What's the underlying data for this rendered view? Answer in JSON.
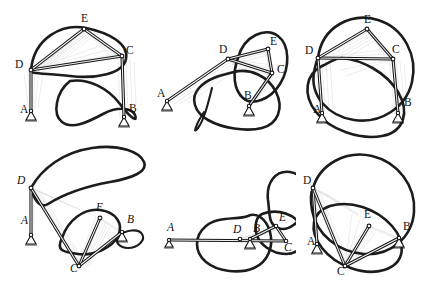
{
  "figure": {
    "background_color": "#ffffff",
    "curve_color": "#1c1c1c",
    "ghost_color": "#c9c9c9",
    "link_color": "#161616",
    "columns": 3,
    "rows": 2,
    "panel_width": 148,
    "panel_height": 143
  },
  "panels": [
    {
      "id": "panel-top-left",
      "name": "top-left",
      "row": 0,
      "col": 0,
      "label_style": "upright",
      "joints": [
        {
          "key": "A",
          "label": "A",
          "x": 31,
          "y": 111,
          "type": "ground",
          "label_x": 20,
          "label_y": 113
        },
        {
          "key": "B",
          "label": "B",
          "x": 124,
          "y": 117,
          "type": "ground",
          "label_x": 129,
          "label_y": 112
        },
        {
          "key": "C",
          "label": "C",
          "x": 122,
          "y": 56,
          "type": "pin",
          "label_x": 126,
          "label_y": 54
        },
        {
          "key": "D",
          "label": "D",
          "x": 31,
          "y": 70,
          "type": "pin",
          "label_x": 15,
          "label_y": 68
        },
        {
          "key": "E",
          "label": "E",
          "x": 84,
          "y": 29,
          "type": "pin",
          "label_x": 81,
          "label_y": 22
        }
      ],
      "links": [
        {
          "from": "A",
          "to": "D"
        },
        {
          "from": "B",
          "to": "C"
        },
        {
          "from": "D",
          "to": "C"
        },
        {
          "from": "D",
          "to": "E"
        },
        {
          "from": "E",
          "to": "C"
        }
      ]
    },
    {
      "id": "panel-top-middle",
      "name": "top-middle",
      "row": 0,
      "col": 1,
      "label_style": "upright",
      "joints": [
        {
          "key": "A",
          "label": "A",
          "x": 167,
          "y": 101,
          "type": "ground",
          "label_x": 157,
          "label_y": 97
        },
        {
          "key": "B",
          "label": "B",
          "x": 249,
          "y": 106,
          "type": "ground",
          "label_x": 244,
          "label_y": 99
        },
        {
          "key": "C",
          "label": "C",
          "x": 272,
          "y": 73,
          "type": "pin",
          "label_x": 277,
          "label_y": 73
        },
        {
          "key": "D",
          "label": "D",
          "x": 228,
          "y": 59,
          "type": "pin",
          "label_x": 219,
          "label_y": 53
        },
        {
          "key": "E",
          "label": "E",
          "x": 268,
          "y": 49,
          "type": "pin",
          "label_x": 270,
          "label_y": 45
        }
      ],
      "links": [
        {
          "from": "A",
          "to": "D"
        },
        {
          "from": "B",
          "to": "C"
        },
        {
          "from": "D",
          "to": "C"
        },
        {
          "from": "D",
          "to": "E"
        },
        {
          "from": "E",
          "to": "C"
        }
      ]
    },
    {
      "id": "panel-top-right",
      "name": "top-right",
      "row": 0,
      "col": 2,
      "label_style": "upright",
      "joints": [
        {
          "key": "A",
          "label": "A",
          "x": 322,
          "y": 113,
          "type": "ground",
          "label_x": 313,
          "label_y": 113
        },
        {
          "key": "B",
          "label": "B",
          "x": 398,
          "y": 113,
          "type": "ground",
          "label_x": 404,
          "label_y": 106
        },
        {
          "key": "C",
          "label": "C",
          "x": 393,
          "y": 59,
          "type": "pin",
          "label_x": 392,
          "label_y": 53
        },
        {
          "key": "D",
          "label": "D",
          "x": 318,
          "y": 58,
          "type": "pin",
          "label_x": 305,
          "label_y": 54
        },
        {
          "key": "E",
          "label": "E",
          "x": 367,
          "y": 29,
          "type": "pin",
          "label_x": 364,
          "label_y": 23
        }
      ],
      "links": [
        {
          "from": "A",
          "to": "D"
        },
        {
          "from": "B",
          "to": "C"
        },
        {
          "from": "D",
          "to": "C"
        },
        {
          "from": "D",
          "to": "E"
        },
        {
          "from": "E",
          "to": "C"
        }
      ]
    },
    {
      "id": "panel-bottom-left",
      "name": "bottom-left",
      "row": 1,
      "col": 0,
      "label_style": "italic",
      "joints": [
        {
          "key": "A",
          "label": "A",
          "x": 31,
          "y": 235,
          "type": "ground",
          "label_x": 21,
          "label_y": 224
        },
        {
          "key": "B",
          "label": "B",
          "x": 122,
          "y": 232,
          "type": "ground",
          "label_x": 127,
          "label_y": 223
        },
        {
          "key": "C",
          "label": "C",
          "x": 79,
          "y": 266,
          "type": "pin",
          "label_x": 70,
          "label_y": 272
        },
        {
          "key": "D",
          "label": "D",
          "x": 31,
          "y": 188,
          "type": "pin",
          "label_x": 17,
          "label_y": 184
        },
        {
          "key": "E",
          "label": "E",
          "x": 100,
          "y": 218,
          "type": "pin",
          "label_x": 96,
          "label_y": 211
        }
      ],
      "links": [
        {
          "from": "A",
          "to": "D"
        },
        {
          "from": "B",
          "to": "E"
        },
        {
          "from": "D",
          "to": "C"
        },
        {
          "from": "C",
          "to": "E"
        }
      ]
    },
    {
      "id": "panel-bottom-middle",
      "name": "bottom-middle",
      "row": 1,
      "col": 1,
      "label_style": "italic",
      "joints": [
        {
          "key": "A",
          "label": "A",
          "x": 169,
          "y": 240,
          "type": "ground",
          "label_x": 167,
          "label_y": 231
        },
        {
          "key": "B",
          "label": "B",
          "x": 250,
          "y": 239,
          "type": "ground",
          "label_x": 253,
          "label_y": 232
        },
        {
          "key": "C",
          "label": "C",
          "x": 286,
          "y": 241,
          "type": "pin",
          "label_x": 284,
          "label_y": 251
        },
        {
          "key": "D",
          "label": "D",
          "x": 240,
          "y": 239,
          "type": "pin",
          "label_x": 233,
          "label_y": 233
        },
        {
          "key": "E",
          "label": "E",
          "x": 276,
          "y": 226,
          "type": "pin",
          "label_x": 279,
          "label_y": 221
        }
      ],
      "links": [
        {
          "from": "A",
          "to": "D"
        },
        {
          "from": "B",
          "to": "E"
        },
        {
          "from": "D",
          "to": "C"
        },
        {
          "from": "E",
          "to": "C"
        }
      ]
    },
    {
      "id": "panel-bottom-right",
      "name": "bottom-right",
      "row": 1,
      "col": 2,
      "label_style": "upright",
      "joints": [
        {
          "key": "A",
          "label": "A",
          "x": 317,
          "y": 244,
          "type": "ground",
          "label_x": 307,
          "label_y": 245
        },
        {
          "key": "B",
          "label": "B",
          "x": 399,
          "y": 238,
          "type": "ground",
          "label_x": 403,
          "label_y": 230
        },
        {
          "key": "C",
          "label": "C",
          "x": 345,
          "y": 266,
          "type": "pin",
          "label_x": 337,
          "label_y": 275
        },
        {
          "key": "D",
          "label": "D",
          "x": 313,
          "y": 188,
          "type": "pin",
          "label_x": 303,
          "label_y": 184
        },
        {
          "key": "E",
          "label": "E",
          "x": 369,
          "y": 226,
          "type": "pin",
          "label_x": 364,
          "label_y": 218
        }
      ],
      "links": [
        {
          "from": "A",
          "to": "D"
        },
        {
          "from": "B",
          "to": "E"
        },
        {
          "from": "D",
          "to": "C"
        },
        {
          "from": "C",
          "to": "E"
        }
      ]
    }
  ]
}
